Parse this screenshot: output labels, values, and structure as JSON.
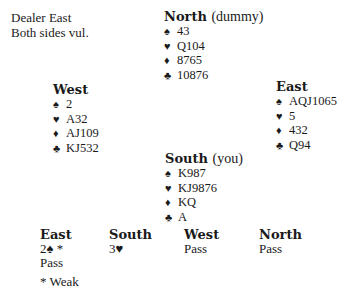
{
  "deal_info": {
    "dealer": "Dealer East",
    "vulnerability": "Both sides vul."
  },
  "suit_icons": {
    "spades": "♠",
    "hearts": "♥",
    "diamonds": "♦",
    "clubs": "♣"
  },
  "hands": {
    "north": {
      "name": "North",
      "role": "(dummy)",
      "spades": "43",
      "hearts": "Q104",
      "diamonds": "8765",
      "clubs": "10876"
    },
    "west": {
      "name": "West",
      "role": "",
      "spades": "2",
      "hearts": "A32",
      "diamonds": "AJ109",
      "clubs": "KJ532"
    },
    "east": {
      "name": "East",
      "role": "",
      "spades": "AQJ1065",
      "hearts": "5",
      "diamonds": "432",
      "clubs": "Q94"
    },
    "south": {
      "name": "South",
      "role": "(you)",
      "spades": "K987",
      "hearts": "KJ9876",
      "diamonds": "KQ",
      "clubs": "A"
    }
  },
  "auction": {
    "columns": [
      {
        "header": "East",
        "calls": [
          "2♠ *",
          "Pass"
        ]
      },
      {
        "header": "South",
        "calls": [
          "3♥"
        ]
      },
      {
        "header": "West",
        "calls": [
          "Pass"
        ]
      },
      {
        "header": "North",
        "calls": [
          "Pass"
        ]
      }
    ],
    "footnote": "* Weak"
  }
}
